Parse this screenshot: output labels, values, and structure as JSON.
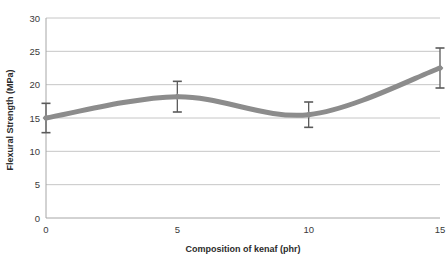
{
  "chart_data": {
    "type": "line",
    "title": "",
    "subtitle": "",
    "xlabel": "Composition of kenaf (phr)",
    "ylabel": "Flexural Strength (MPa)",
    "x": [
      0,
      5,
      10,
      15
    ],
    "xticklabels": [
      "0",
      "5",
      "10",
      "15"
    ],
    "yticklabels": [
      "0",
      "5",
      "10",
      "15",
      "20",
      "25",
      "30"
    ],
    "yticks": [
      0,
      5,
      10,
      15,
      20,
      25,
      30
    ],
    "xlim": [
      0,
      15
    ],
    "ylim": [
      0,
      30
    ],
    "grid": "horizontal",
    "legend": "none",
    "smoothing": "spline",
    "series": [
      {
        "name": "Flexural Strength",
        "values": [
          15.0,
          18.2,
          15.5,
          22.5
        ],
        "errors": [
          2.2,
          2.3,
          1.9,
          3.0
        ],
        "color": "#8c8c8c",
        "marker": "diamond",
        "line_width": 5
      }
    ],
    "annotations": []
  },
  "axes": {
    "x_title": "Composition of kenaf (phr)",
    "y_title": "Flexural Strength (MPa)",
    "x_ticks": [
      "0",
      "5",
      "10",
      "15"
    ],
    "y_ticks": [
      "0",
      "5",
      "10",
      "15",
      "20",
      "25",
      "30"
    ]
  },
  "colors": {
    "series": "#8c8c8c",
    "grid": "#bfbfbf",
    "axis": "#a6a6a6",
    "error_bar": "#5a5a5a",
    "text": "#2b2b2b",
    "background": "#ffffff"
  }
}
